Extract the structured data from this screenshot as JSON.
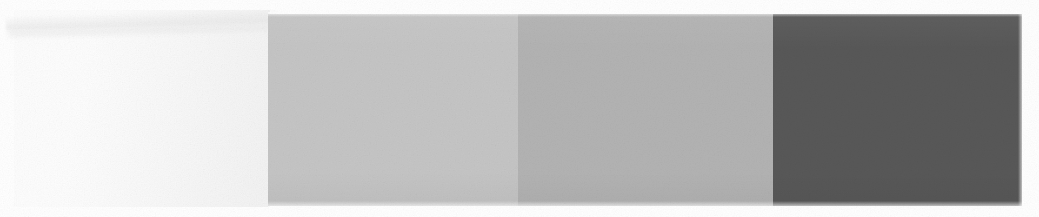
{
  "document": {
    "title": "Grayscale Step Wedge Scan",
    "kind": "scanned-grayscale-calibration-strip",
    "width_px": 1039,
    "height_px": 217,
    "background_color": "#ffffff"
  },
  "paper": {
    "label": "paper-background-field",
    "left_px": 14,
    "top_px": 10,
    "width_px": 256,
    "height_px": 197,
    "color_light": "#fdfdfd",
    "color_dark": "#f2f2f2",
    "artifact": "diagonal-scanner-streak"
  },
  "strip": {
    "label": "grayscale-step-wedge",
    "left_px": 268,
    "top_px": 14,
    "width_px": 754,
    "height_px": 192,
    "patch_count": 3,
    "patches": [
      {
        "index": 1,
        "name": "light-gray-patch",
        "color": "#c5c5c5",
        "width_px": 250,
        "approx_gray_value": 197,
        "approx_density": "0.11"
      },
      {
        "index": 2,
        "name": "mid-gray-patch",
        "color": "#b3b3b3",
        "width_px": 255,
        "approx_gray_value": 179,
        "approx_density": "0.15"
      },
      {
        "index": 3,
        "name": "dark-gray-patch",
        "color": "#585858",
        "width_px": 249,
        "approx_gray_value": 88,
        "approx_density": "0.46"
      }
    ]
  },
  "chart_data": {
    "type": "bar",
    "xlabel": "Step",
    "ylabel": "Gray level (0-255)",
    "categories": [
      "paper",
      "step 1",
      "step 2",
      "step 3"
    ],
    "values": [
      248,
      197,
      179,
      88
    ],
    "ylim": [
      0,
      255
    ],
    "grid": false,
    "legend": "none",
    "colors": [
      "#f7f7f7",
      "#c5c5c5",
      "#b3b3b3",
      "#585858"
    ]
  }
}
